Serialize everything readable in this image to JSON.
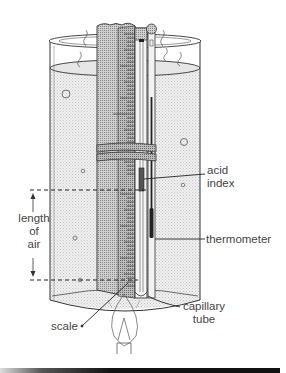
{
  "diagram": {
    "labels": {
      "acid_index": [
        "acid",
        "index"
      ],
      "length_of_air": [
        "length",
        "of",
        "air"
      ],
      "thermometer": "thermometer",
      "scale": "scale",
      "capillary_tube": [
        "capillary",
        "tube"
      ]
    },
    "components": [
      "beaker-of-water",
      "scale",
      "capillary-tube",
      "acid-index",
      "thermometer",
      "rubber-bands",
      "bunsen-flame"
    ],
    "colors": {
      "line": "#333333",
      "water_shade": "#e4e4e4",
      "scale_shade": "#bdbdbd",
      "text": "#444444"
    }
  }
}
